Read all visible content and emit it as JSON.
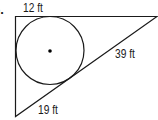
{
  "problem": {
    "number": "6.",
    "labels": {
      "top": "12 ft",
      "hypotenuse": "39 ft",
      "bottom": "19 ft"
    }
  },
  "figure": {
    "shape": "right triangle with inscribed circle",
    "stroke_color": "#1a1a1a",
    "background": "#ffffff"
  }
}
